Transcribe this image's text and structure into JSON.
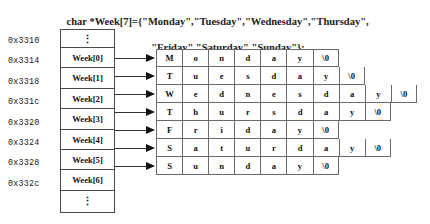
{
  "code_header": {
    "line1": "char *Week[7]={\"Monday\",\"Tuesday\",\"Wednesday\",\"Thursday\",",
    "line2": "\"Friday\",\"Saturday\",\"Sunday\"};"
  },
  "addresses": [
    {
      "label": "0x3310"
    },
    {
      "label": "0x3314"
    },
    {
      "label": "0x3318"
    },
    {
      "label": "0x331c"
    },
    {
      "label": "0x3320"
    },
    {
      "label": "0x3324"
    },
    {
      "label": "0x3328"
    },
    {
      "label": "0x332c"
    }
  ],
  "pointer_array": {
    "top_ellipsis": "⋮",
    "bottom_ellipsis": "⋮",
    "cells": [
      {
        "label": "Week[0]"
      },
      {
        "label": "Week[1]"
      },
      {
        "label": "Week[2]"
      },
      {
        "label": "Week[3]"
      },
      {
        "label": "Week[4]"
      },
      {
        "label": "Week[5]"
      },
      {
        "label": "Week[6]"
      }
    ]
  },
  "string_rows": [
    {
      "name": "Monday",
      "chars": [
        "M",
        "o",
        "n",
        "d",
        "a",
        "y",
        "\\0"
      ]
    },
    {
      "name": "Tuesday",
      "chars": [
        "T",
        "u",
        "e",
        "s",
        "d",
        "a",
        "y",
        "\\0"
      ]
    },
    {
      "name": "Wednesday",
      "chars": [
        "W",
        "e",
        "d",
        "n",
        "e",
        "s",
        "d",
        "a",
        "y",
        "\\0"
      ]
    },
    {
      "name": "Thursday",
      "chars": [
        "T",
        "h",
        "u",
        "r",
        "s",
        "d",
        "a",
        "y",
        "\\0"
      ]
    },
    {
      "name": "Friday",
      "chars": [
        "F",
        "r",
        "i",
        "d",
        "a",
        "y",
        "\\0"
      ]
    },
    {
      "name": "Saturday",
      "chars": [
        "S",
        "a",
        "t",
        "u",
        "r",
        "d",
        "a",
        "y",
        "\\0"
      ]
    },
    {
      "name": "Sunday",
      "chars": [
        "S",
        "u",
        "n",
        "d",
        "a",
        "y",
        "\\0"
      ]
    }
  ],
  "colors": {
    "background": "#ffffff",
    "text": "#1a1a1a",
    "box_border": "#4a4a4a",
    "grid_border": "#6a6a6a",
    "arrow": "#111111"
  }
}
